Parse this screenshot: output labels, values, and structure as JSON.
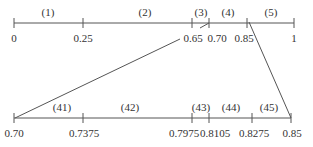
{
  "top_interval": {
    "segments": [
      {
        "label": "(1)",
        "x": 48
      },
      {
        "label": "(2)",
        "x": 145
      },
      {
        "label": "(3)",
        "x": 201
      },
      {
        "label": "(4)",
        "x": 228
      },
      {
        "label": "(5)",
        "x": 271
      }
    ],
    "ticks": [
      {
        "label": "0",
        "x": 14
      },
      {
        "label": "0.25",
        "x": 83
      },
      {
        "label": "0.65",
        "x": 194
      },
      {
        "label": "0.70",
        "x": 211
      },
      {
        "label": "0.85",
        "x": 249
      },
      {
        "label": "1",
        "x": 294
      }
    ]
  },
  "bottom_interval": {
    "segments": [
      {
        "label": "(41)",
        "x": 62
      },
      {
        "label": "(42)",
        "x": 130
      },
      {
        "label": "(43)",
        "x": 201
      },
      {
        "label": "(44)",
        "x": 231
      },
      {
        "label": "(45)",
        "x": 269
      }
    ],
    "ticks": [
      {
        "label": "0.70",
        "x": 14
      },
      {
        "label": "0.7375",
        "x": 83
      },
      {
        "label": "0.7975",
        "x": 191
      },
      {
        "label": "0.8105",
        "x": 212
      },
      {
        "label": "0.8275",
        "x": 252
      },
      {
        "label": "0.85",
        "x": 291
      }
    ]
  },
  "line_color": "#555555"
}
